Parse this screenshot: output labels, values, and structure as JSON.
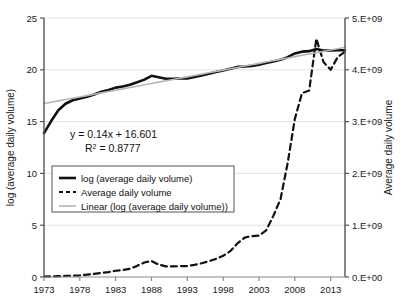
{
  "chart_data": {
    "type": "line",
    "title": "",
    "xlabel": "",
    "ylabel": "log (average daily volume)",
    "y2label": "Average daily volume",
    "xlim": [
      1973,
      2015
    ],
    "ylim": [
      0,
      25
    ],
    "y2lim": [
      0,
      5000000000
    ],
    "grid": true,
    "legend_position": "center-left",
    "x_ticks": [
      "1973",
      "1978",
      "1983",
      "1988",
      "1993",
      "1998",
      "2003",
      "2008",
      "2013"
    ],
    "x_tick_values": [
      1973,
      1978,
      1983,
      1988,
      1993,
      1998,
      2003,
      2008,
      2013
    ],
    "y_ticks": [
      "0",
      "5",
      "10",
      "15",
      "20",
      "25"
    ],
    "y_tick_values": [
      0,
      5,
      10,
      15,
      20,
      25
    ],
    "y2_ticks": [
      "0.E+00",
      "1.E+09",
      "2.E+09",
      "3.E+09",
      "4.E+09",
      "5.E+09"
    ],
    "y2_tick_values": [
      0,
      1000000000,
      2000000000,
      3000000000,
      4000000000,
      5000000000
    ],
    "annotations": [
      {
        "name": "trend-equation",
        "text": "y = 0.14x + 16.601"
      },
      {
        "name": "r-squared",
        "text": "R",
        "sup": "2",
        "rest": " = 0.8777"
      }
    ],
    "x": [
      1973,
      1974,
      1975,
      1976,
      1977,
      1978,
      1979,
      1980,
      1981,
      1982,
      1983,
      1984,
      1985,
      1986,
      1987,
      1988,
      1989,
      1990,
      1991,
      1992,
      1993,
      1994,
      1995,
      1996,
      1997,
      1998,
      1999,
      2000,
      2001,
      2002,
      2003,
      2004,
      2005,
      2006,
      2007,
      2008,
      2009,
      2010,
      2011,
      2012,
      2013,
      2014,
      2015
    ],
    "series": [
      {
        "name": "log (average daily volume)",
        "axis": "left",
        "style": "solid",
        "color": "#111111",
        "width": 2.6,
        "values": [
          13.88,
          15.05,
          16.1,
          16.72,
          17.06,
          17.22,
          17.4,
          17.62,
          17.88,
          18.05,
          18.28,
          18.38,
          18.55,
          18.8,
          19.05,
          19.42,
          19.28,
          19.14,
          19.14,
          19.16,
          19.17,
          19.3,
          19.45,
          19.62,
          19.78,
          19.93,
          20.1,
          20.28,
          20.32,
          20.38,
          20.5,
          20.66,
          20.8,
          20.96,
          21.22,
          21.58,
          21.75,
          21.8,
          22.0,
          21.86,
          21.86,
          21.88,
          21.88
        ]
      },
      {
        "name": "Average daily volume",
        "axis": "right",
        "style": "dashed",
        "color": "#111111",
        "width": 2.2,
        "values": [
          10000000,
          12000000,
          15000000,
          20000000,
          26000000,
          32000000,
          45000000,
          62000000,
          80000000,
          95000000,
          120000000,
          135000000,
          160000000,
          215000000,
          280000000,
          310000000,
          240000000,
          205000000,
          205000000,
          210000000,
          212000000,
          235000000,
          265000000,
          305000000,
          350000000,
          410000000,
          500000000,
          650000000,
          760000000,
          790000000,
          800000000,
          900000000,
          1180000000,
          1500000000,
          2200000000,
          3050000000,
          3550000000,
          3600000000,
          4600000000,
          4150000000,
          4000000000,
          4250000000,
          4350000000
        ]
      },
      {
        "name": "Linear (log (average daily volume))",
        "axis": "left",
        "style": "solid",
        "color": "#b5b5b5",
        "width": 1.6,
        "values": [
          16.74,
          16.87,
          17.0,
          17.13,
          17.26,
          17.38,
          17.51,
          17.64,
          17.77,
          17.9,
          18.03,
          18.16,
          18.29,
          18.42,
          18.55,
          18.68,
          18.81,
          18.94,
          19.07,
          19.2,
          19.32,
          19.45,
          19.58,
          19.71,
          19.84,
          19.97,
          20.1,
          20.23,
          20.36,
          20.49,
          20.62,
          20.75,
          20.88,
          21.01,
          21.14,
          21.27,
          21.4,
          21.52,
          21.65,
          21.78,
          21.91,
          22.04,
          22.17
        ]
      }
    ],
    "legend": [
      {
        "label": "log (average daily volume)",
        "style": "solid",
        "color": "#111111",
        "width": 2.6
      },
      {
        "label": "Average daily volume",
        "style": "dashed",
        "color": "#111111",
        "width": 2.2
      },
      {
        "label": "Linear (log (average daily volume))",
        "style": "solid",
        "color": "#b5b5b5",
        "width": 1.6
      }
    ]
  }
}
